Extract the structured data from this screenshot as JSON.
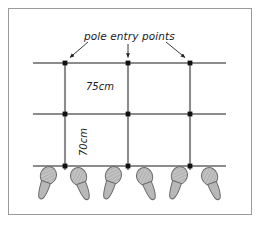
{
  "figure": {
    "title": "pole entry points",
    "background_color": "#ffffff",
    "frame_color": "#9a9a9a"
  },
  "annotations": {
    "title_label": "pole entry points",
    "spacing_horizontal": "75cm",
    "spacing_vertical": "70cm"
  },
  "diagram": {
    "type": "training-grid-poles",
    "pole_color": "#8c8c8c",
    "marker_color": "#111111",
    "arrow_color": "#222222",
    "footprint_fill": "#b8b8b8",
    "footprint_stroke": "#6a6a6a",
    "horizontal_poles": [
      {
        "name": "top-pole",
        "y": 63,
        "x1": 33,
        "x2": 226
      },
      {
        "name": "middle-pole",
        "y": 114,
        "x1": 33,
        "x2": 226
      },
      {
        "name": "bottom-pole",
        "y": 166,
        "x1": 33,
        "x2": 226
      }
    ],
    "vertical_poles": [
      {
        "name": "left-pole",
        "x": 65,
        "y1": 61,
        "y2": 170
      },
      {
        "name": "center-pole",
        "x": 128,
        "y1": 61,
        "y2": 170
      },
      {
        "name": "right-pole",
        "x": 190,
        "y1": 61,
        "y2": 170
      }
    ],
    "entry_markers": [
      {
        "x": 65,
        "y": 63
      },
      {
        "x": 128,
        "y": 63
      },
      {
        "x": 190,
        "y": 63
      },
      {
        "x": 65,
        "y": 114
      },
      {
        "x": 128,
        "y": 114
      },
      {
        "x": 190,
        "y": 114
      },
      {
        "x": 65,
        "y": 166
      },
      {
        "x": 128,
        "y": 166
      },
      {
        "x": 190,
        "y": 166
      }
    ],
    "arrows": [
      {
        "name": "arrow-to-left-entry",
        "x1": 86,
        "y1": 43,
        "x2": 68,
        "y2": 59
      },
      {
        "name": "arrow-to-center-entry",
        "x1": 128,
        "y1": 45,
        "x2": 128,
        "y2": 59
      },
      {
        "name": "arrow-to-right-entry",
        "x1": 168,
        "y1": 43,
        "x2": 187,
        "y2": 59
      }
    ],
    "footprints": [
      {
        "name": "footprint-1",
        "x": 46,
        "y": 182,
        "side": "right"
      },
      {
        "name": "footprint-2",
        "x": 80,
        "y": 183,
        "side": "left"
      },
      {
        "name": "footprint-3",
        "x": 110,
        "y": 182,
        "side": "right"
      },
      {
        "name": "footprint-4",
        "x": 146,
        "y": 183,
        "side": "left"
      },
      {
        "name": "footprint-5",
        "x": 176,
        "y": 182,
        "side": "right"
      },
      {
        "name": "footprint-6",
        "x": 211,
        "y": 183,
        "side": "left"
      }
    ]
  }
}
